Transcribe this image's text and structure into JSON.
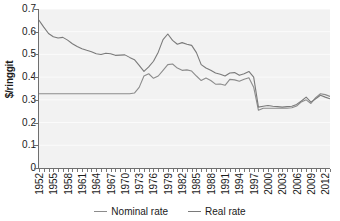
{
  "chart_data": {
    "type": "line",
    "title": "",
    "xlabel": "",
    "ylabel": "$/ringgit",
    "ylim": [
      0,
      0.7
    ],
    "ytick_values": [
      0,
      0.1,
      0.2,
      0.3,
      0.4,
      0.5,
      0.6,
      0.7
    ],
    "ytick_labels": [
      "0",
      "0.1",
      "0.2",
      "0.3",
      "0.4",
      "0.5",
      "0.6",
      "0.7"
    ],
    "xlim": [
      1952,
      2013
    ],
    "xtick_labels": [
      "1952",
      "1955",
      "1958",
      "1961",
      "1964",
      "1967",
      "1970",
      "1973",
      "1976",
      "1979",
      "1982",
      "1985",
      "1988",
      "1991",
      "1994",
      "1997",
      "2000",
      "2003",
      "2006",
      "2009",
      "2012"
    ],
    "grid": "horizontal-white-on-gray",
    "legend_position": "bottom-center",
    "x": [
      1952,
      1953,
      1954,
      1955,
      1956,
      1957,
      1958,
      1959,
      1960,
      1961,
      1962,
      1963,
      1964,
      1965,
      1966,
      1967,
      1968,
      1969,
      1970,
      1971,
      1972,
      1973,
      1974,
      1975,
      1976,
      1977,
      1978,
      1979,
      1980,
      1981,
      1982,
      1983,
      1984,
      1985,
      1986,
      1987,
      1988,
      1989,
      1990,
      1991,
      1992,
      1993,
      1994,
      1995,
      1996,
      1997,
      1998,
      1999,
      2000,
      2001,
      2002,
      2003,
      2004,
      2005,
      2006,
      2007,
      2008,
      2009,
      2010,
      2011,
      2012,
      2013
    ],
    "series": [
      {
        "name": "Nominal rate",
        "color": "#8c8c8c",
        "values": [
          0.327,
          0.327,
          0.327,
          0.327,
          0.327,
          0.327,
          0.327,
          0.327,
          0.327,
          0.327,
          0.327,
          0.327,
          0.327,
          0.327,
          0.327,
          0.327,
          0.327,
          0.327,
          0.327,
          0.327,
          0.33,
          0.355,
          0.405,
          0.415,
          0.395,
          0.405,
          0.43,
          0.455,
          0.458,
          0.44,
          0.43,
          0.432,
          0.427,
          0.405,
          0.385,
          0.396,
          0.385,
          0.369,
          0.37,
          0.364,
          0.39,
          0.388,
          0.382,
          0.391,
          0.397,
          0.356,
          0.254,
          0.263,
          0.263,
          0.263,
          0.263,
          0.263,
          0.263,
          0.265,
          0.273,
          0.291,
          0.3,
          0.284,
          0.31,
          0.327,
          0.323,
          0.315
        ]
      },
      {
        "name": "Real rate",
        "color": "#7a7a7a",
        "values": [
          0.65,
          0.62,
          0.592,
          0.578,
          0.572,
          0.575,
          0.563,
          0.547,
          0.535,
          0.525,
          0.518,
          0.512,
          0.503,
          0.5,
          0.505,
          0.503,
          0.496,
          0.497,
          0.498,
          0.487,
          0.477,
          0.452,
          0.425,
          0.445,
          0.47,
          0.51,
          0.565,
          0.59,
          0.562,
          0.545,
          0.552,
          0.545,
          0.54,
          0.508,
          0.455,
          0.44,
          0.43,
          0.418,
          0.413,
          0.405,
          0.418,
          0.42,
          0.408,
          0.415,
          0.425,
          0.4,
          0.268,
          0.272,
          0.275,
          0.272,
          0.27,
          0.268,
          0.27,
          0.272,
          0.28,
          0.295,
          0.312,
          0.29,
          0.305,
          0.32,
          0.312,
          0.305
        ]
      }
    ],
    "legend": [
      {
        "label": "Nominal rate",
        "color": "#8c8c8c"
      },
      {
        "label": "Real rate",
        "color": "#7a7a7a"
      }
    ]
  }
}
